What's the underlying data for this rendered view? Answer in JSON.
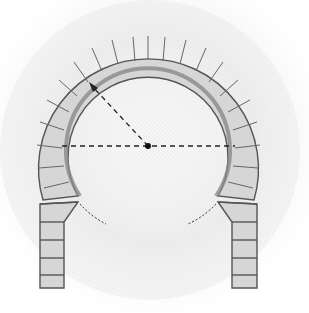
{
  "diagram": {
    "components": [
      {
        "name": "voussoir-ring",
        "description": "Ring of wedge-shaped stones forming the arch"
      },
      {
        "name": "intrados",
        "description": "Inner curve of the arch, extending beyond a semicircle"
      },
      {
        "name": "center-point",
        "description": "Center of the arch circle"
      },
      {
        "name": "radius-line",
        "description": "Dashed arrow from center to intrados"
      },
      {
        "name": "diameter-line",
        "description": "Dashed horizontal line through center"
      },
      {
        "name": "circle-continuation",
        "description": "Dashed arcs continuing the circle below the imposts"
      },
      {
        "name": "left-pier",
        "description": "Left jamb with stacked blocks"
      },
      {
        "name": "right-pier",
        "description": "Right jamb with stacked blocks"
      }
    ],
    "geometry": {
      "center": [
        148,
        146
      ],
      "inner_radius": 87,
      "outer_radius": 113
    },
    "colors": {
      "stone": "#d6d6d6",
      "outline": "#555555",
      "shadow_band": "#8a8a8a",
      "stipple": "#cfcfcf",
      "dash": "#222222"
    }
  }
}
